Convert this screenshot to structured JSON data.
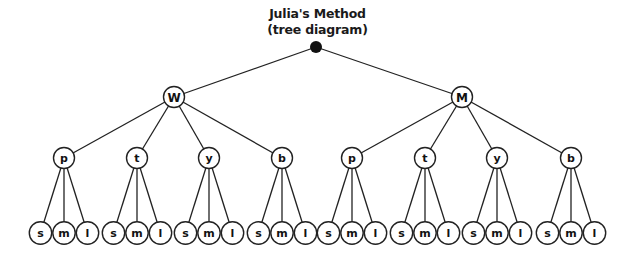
{
  "title": {
    "line1": "Julia's Method",
    "line2": "(tree diagram)"
  },
  "colors": {
    "stroke": "#222222",
    "fill": "#ffffff",
    "root": "#111111"
  },
  "tree": {
    "root": {
      "label": "",
      "x": 316,
      "y": 47
    },
    "level1": [
      {
        "label": "W",
        "x": 174,
        "y": 97
      },
      {
        "label": "M",
        "x": 462,
        "y": 97
      }
    ],
    "level2": [
      {
        "label": "p",
        "x": 64,
        "parent": 0
      },
      {
        "label": "t",
        "x": 137,
        "parent": 0
      },
      {
        "label": "y",
        "x": 209,
        "parent": 0
      },
      {
        "label": "b",
        "x": 282,
        "parent": 0
      },
      {
        "label": "p",
        "x": 352,
        "parent": 1
      },
      {
        "label": "t",
        "x": 425,
        "parent": 1
      },
      {
        "label": "y",
        "x": 497,
        "parent": 1
      },
      {
        "label": "b",
        "x": 571,
        "parent": 1
      }
    ],
    "level2_y": 158,
    "leaf_labels": [
      "s",
      "m",
      "l"
    ],
    "leaf_y": 233,
    "leaf_offset": 23.5
  }
}
